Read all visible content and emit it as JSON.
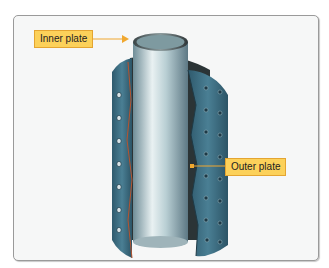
{
  "caption": "",
  "figure": {
    "labels": {
      "inner_plate": "Inner plate",
      "outer_plate": "Outer plate"
    },
    "colors": {
      "label_fill": "#fcd15a",
      "label_border": "#e4a531",
      "leader_line": "#f0a830",
      "outer_plate": "#3e6f85",
      "inner_plate": "#a9c2c9"
    }
  }
}
